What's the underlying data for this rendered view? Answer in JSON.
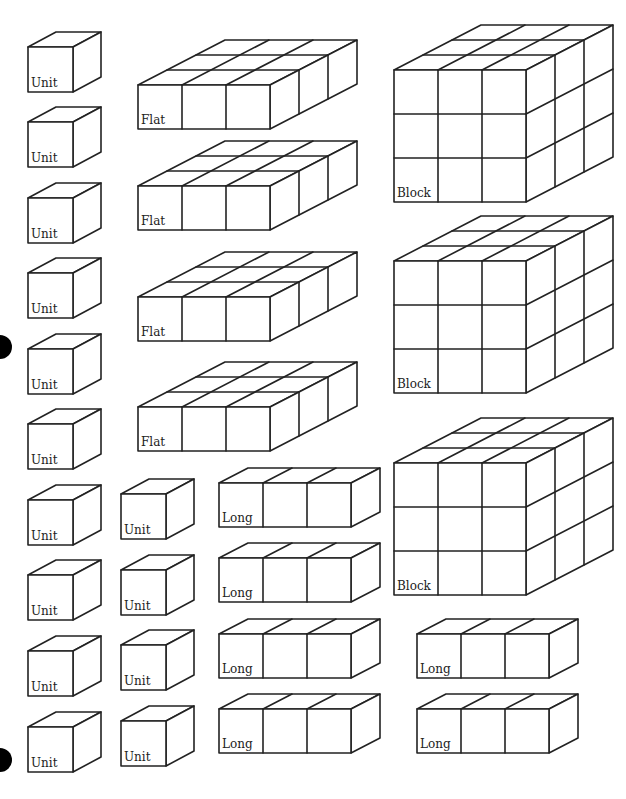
{
  "colors": {
    "line": "#222222",
    "background": "#ffffff",
    "dot": "#000000"
  },
  "labels": {
    "unit": "Unit",
    "long": "Long",
    "flat": "Flat",
    "block": "Block"
  },
  "counts": {
    "units": 14,
    "longs": 6,
    "flats": 4,
    "blocks": 3
  },
  "geometry": {
    "cell": 44,
    "depth_dx": 29,
    "depth_dy": -15,
    "unit_size": 45,
    "unit_dx": 28,
    "unit_dy": -15
  },
  "units": [
    {
      "x": 28,
      "y": 47
    },
    {
      "x": 28,
      "y": 122
    },
    {
      "x": 28,
      "y": 198
    },
    {
      "x": 28,
      "y": 273
    },
    {
      "x": 28,
      "y": 349
    },
    {
      "x": 28,
      "y": 424
    },
    {
      "x": 28,
      "y": 500
    },
    {
      "x": 28,
      "y": 575
    },
    {
      "x": 28,
      "y": 651
    },
    {
      "x": 28,
      "y": 727
    },
    {
      "x": 121,
      "y": 494
    },
    {
      "x": 121,
      "y": 570
    },
    {
      "x": 121,
      "y": 645
    },
    {
      "x": 121,
      "y": 721
    }
  ],
  "longs": [
    {
      "x": 219,
      "y": 483
    },
    {
      "x": 219,
      "y": 558
    },
    {
      "x": 219,
      "y": 634
    },
    {
      "x": 219,
      "y": 709
    },
    {
      "x": 417,
      "y": 634
    },
    {
      "x": 417,
      "y": 709
    }
  ],
  "flats": [
    {
      "x": 138,
      "y": 85
    },
    {
      "x": 138,
      "y": 186
    },
    {
      "x": 138,
      "y": 297
    },
    {
      "x": 138,
      "y": 407
    }
  ],
  "blocks": [
    {
      "x": 394,
      "y": 70
    },
    {
      "x": 394,
      "y": 261
    },
    {
      "x": 394,
      "y": 463
    }
  ],
  "bullets": [
    {
      "x": -12,
      "y": 335,
      "d": 24
    },
    {
      "x": -12,
      "y": 748,
      "d": 24
    }
  ]
}
